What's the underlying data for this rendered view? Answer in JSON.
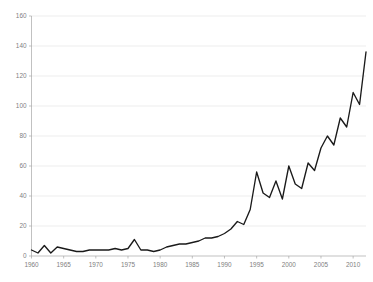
{
  "chart_data": {
    "type": "line",
    "title": "",
    "subtitle": "",
    "xlabel": "",
    "ylabel": "",
    "xlim": [
      1960,
      2012
    ],
    "ylim": [
      0,
      160
    ],
    "grid": true,
    "legend": false,
    "legend_position": "none",
    "line_color": "#1a1a1a",
    "grid_color": "#d9d9d9",
    "axis_color": "#a6a6a6",
    "tick_label_color": "#808080",
    "yticks": [
      0,
      20,
      40,
      60,
      80,
      100,
      120,
      140,
      160
    ],
    "ytick_labels": [
      "0",
      "20",
      "40",
      "60",
      "80",
      "100",
      "120",
      "140",
      "160"
    ],
    "xticks": [
      1960,
      1965,
      1970,
      1975,
      1980,
      1985,
      1990,
      1995,
      2000,
      2005,
      2010
    ],
    "xtick_labels": [
      "1960",
      "1965",
      "1970",
      "1975",
      "1980",
      "1985",
      "1990",
      "1995",
      "2000",
      "2005",
      "2010"
    ],
    "x": [
      1960,
      1961,
      1962,
      1963,
      1964,
      1965,
      1966,
      1967,
      1968,
      1969,
      1970,
      1971,
      1972,
      1973,
      1974,
      1975,
      1976,
      1977,
      1978,
      1979,
      1980,
      1981,
      1982,
      1983,
      1984,
      1985,
      1986,
      1987,
      1988,
      1989,
      1990,
      1991,
      1992,
      1993,
      1994,
      1995,
      1996,
      1997,
      1998,
      1999,
      2000,
      2001,
      2002,
      2003,
      2004,
      2005,
      2006,
      2007,
      2008,
      2009,
      2010,
      2011,
      2012
    ],
    "values": [
      4,
      2,
      7,
      2,
      6,
      5,
      4,
      3,
      3,
      4,
      4,
      4,
      4,
      5,
      4,
      5,
      11,
      4,
      4,
      3,
      4,
      6,
      7,
      8,
      8,
      9,
      10,
      12,
      12,
      13,
      15,
      18,
      23,
      21,
      31,
      56,
      42,
      39,
      50,
      38,
      60,
      48,
      45,
      62,
      57,
      72,
      80,
      74,
      92,
      86,
      109,
      101,
      136
    ],
    "series": [
      {
        "name": "series-1",
        "color": "#1a1a1a",
        "values": [
          4,
          2,
          7,
          2,
          6,
          5,
          4,
          3,
          3,
          4,
          4,
          4,
          4,
          5,
          4,
          5,
          11,
          4,
          4,
          3,
          4,
          6,
          7,
          8,
          8,
          9,
          10,
          12,
          12,
          13,
          15,
          18,
          23,
          21,
          31,
          56,
          42,
          39,
          50,
          38,
          60,
          48,
          45,
          62,
          57,
          72,
          80,
          74,
          92,
          86,
          109,
          101,
          136
        ]
      }
    ]
  }
}
